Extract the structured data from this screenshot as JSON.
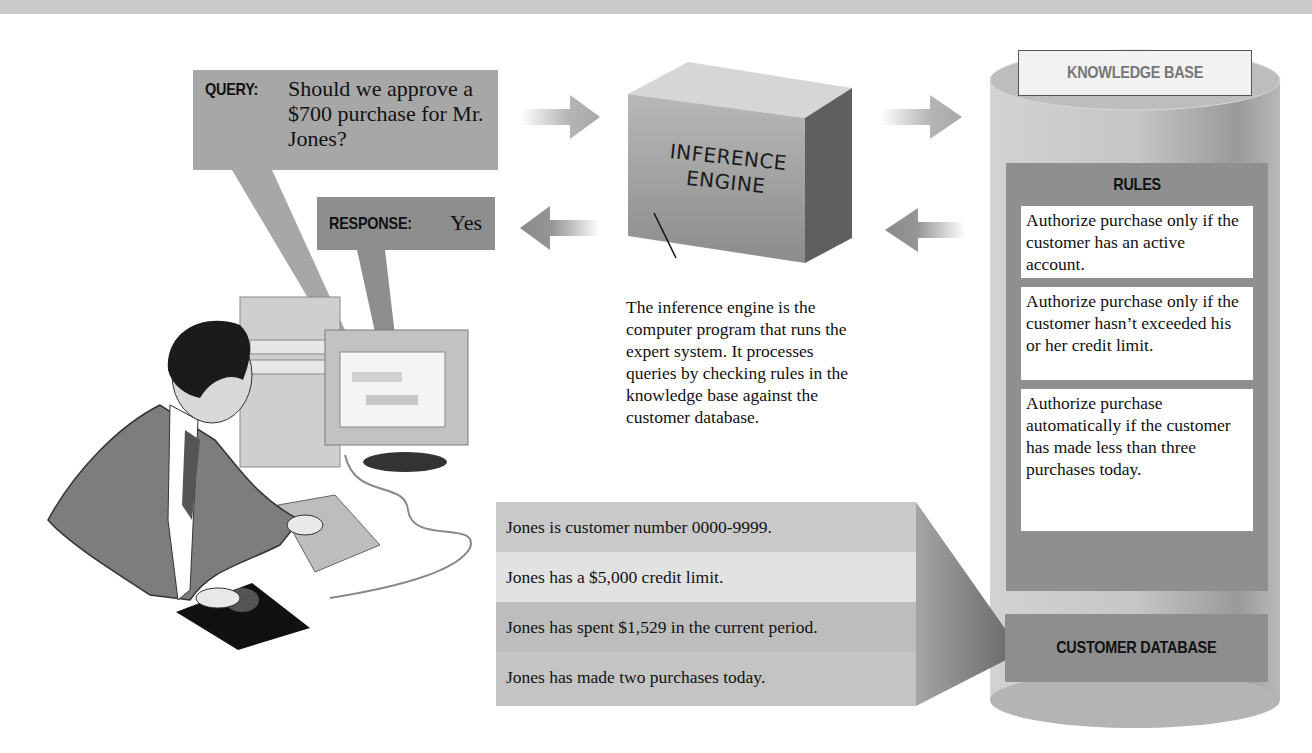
{
  "header": {
    "clipped_title": "...(partially visible heading, cut off)"
  },
  "query": {
    "label": "QUERY:",
    "text": "Should we approve a $700 purchase for Mr. Jones?"
  },
  "response": {
    "label": "RESPONSE:",
    "text": "Yes"
  },
  "inference_engine": {
    "line1": "INFERENCE",
    "line2": "ENGINE",
    "caption": "The inference engine is the computer program that runs the expert system. It processes queries by checking rules in the knowledge base against the customer database."
  },
  "knowledge_base": {
    "title": "KNOWLEDGE BASE",
    "rules_title": "RULES",
    "rules": [
      "Authorize purchase only if the customer has an active account.",
      "Authorize purchase only if the customer hasn’t exceeded his or her credit limit.",
      "Authorize purchase automatically if the customer has made less than three purchases today."
    ],
    "database_title": "CUSTOMER DATABASE"
  },
  "customer_facts": [
    "Jones is customer number 0000-9999.",
    "Jones has a $5,000 credit limit.",
    "Jones has spent $1,529 in the current period.",
    "Jones has made two purchases today."
  ],
  "colors": {
    "query_box": "#a7a7a7",
    "response_box": "#8e8e8e",
    "rules_panel": "#8f8f8f",
    "rule_card": "#ffffff",
    "fact_rows": [
      "#c9c9c9",
      "#e2e2e2",
      "#bdbdbd",
      "#c4c4c4"
    ]
  }
}
